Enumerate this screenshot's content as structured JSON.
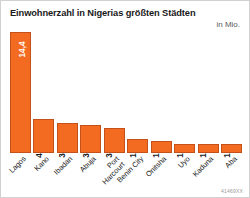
{
  "chart_data": {
    "type": "bar",
    "title": "Einwohnerzahl in Nigerias größten Städten",
    "subtitle": "in Mio.",
    "xlabel": "",
    "ylabel": "",
    "unit": "Mio.",
    "ylim": [
      0,
      14.4
    ],
    "grid": false,
    "legend": false,
    "orientation": "vertical",
    "bar_color": "#F26B21",
    "bar_border_color": "#C4501A",
    "categories": [
      "Lagos",
      "Kano",
      "Ibadan",
      "Abuja",
      "Port Harcourt",
      "Benin City",
      "Onitsha",
      "Uyo",
      "Kaduna",
      "Aba"
    ],
    "values": [
      14.4,
      4.0,
      3.6,
      3.3,
      3.0,
      1.7,
      1.4,
      1.1,
      1.1,
      1.1
    ],
    "value_labels": [
      "14,4",
      "4,0",
      "3,6",
      "3,3",
      "3,0",
      "1,7",
      "1,4",
      "1,1",
      "1,1",
      "1,1"
    ],
    "category_label_lines": [
      [
        "Lagos"
      ],
      [
        "Kano"
      ],
      [
        "Ibadan"
      ],
      [
        "Abuja"
      ],
      [
        "Port",
        "Harcourt"
      ],
      [
        "Benin City"
      ],
      [
        "Onitsha"
      ],
      [
        "Uyo"
      ],
      [
        "Kaduna"
      ],
      [
        "Aba"
      ]
    ]
  },
  "footer": {
    "source_code": "41469XX"
  }
}
